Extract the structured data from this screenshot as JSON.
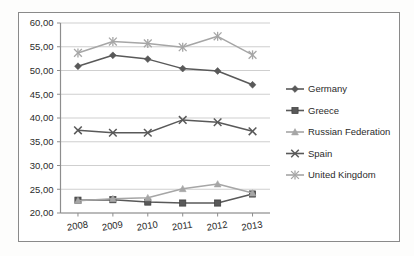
{
  "chart_data": {
    "type": "line",
    "title": "",
    "subtitle": "",
    "xlabel": "",
    "ylabel": "",
    "categories": [
      "2008",
      "2009",
      "2010",
      "2011",
      "2012",
      "2013"
    ],
    "ylim": [
      20.0,
      60.0
    ],
    "ytick_values": [
      20.0,
      25.0,
      30.0,
      35.0,
      40.0,
      45.0,
      50.0,
      55.0,
      60.0
    ],
    "ytick_labels": [
      "20,00",
      "25,00",
      "30,00",
      "35,00",
      "40,00",
      "45,00",
      "50,00",
      "55,00",
      "60,00"
    ],
    "grid": true,
    "legend_position": "right",
    "series": [
      {
        "name": "Germany",
        "marker": "diamond",
        "color": "#595959",
        "values": [
          50.9,
          53.2,
          52.4,
          50.4,
          49.9,
          47.0
        ]
      },
      {
        "name": "Greece",
        "marker": "square",
        "color": "#595959",
        "values": [
          22.7,
          22.8,
          22.3,
          22.1,
          22.1,
          24.0
        ]
      },
      {
        "name": "Russian Federation",
        "marker": "triangle",
        "color": "#a6a6a6",
        "values": [
          22.6,
          23.0,
          23.2,
          25.1,
          26.1,
          24.2
        ]
      },
      {
        "name": "Spain",
        "marker": "cross",
        "color": "#595959",
        "values": [
          37.4,
          36.9,
          36.9,
          39.6,
          39.1,
          37.2
        ]
      },
      {
        "name": "United Kingdom",
        "marker": "star",
        "color": "#a6a6a6",
        "values": [
          53.7,
          56.1,
          55.7,
          54.9,
          57.2,
          53.3
        ]
      }
    ]
  },
  "legend": {
    "items": [
      {
        "label": "Germany"
      },
      {
        "label": "Greece"
      },
      {
        "label": "Russian Federation"
      },
      {
        "label": "Spain"
      },
      {
        "label": "United Kingdom"
      }
    ]
  }
}
